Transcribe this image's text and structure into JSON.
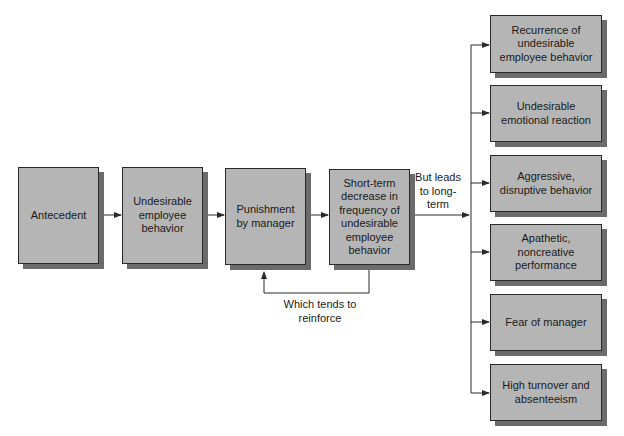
{
  "diagram": {
    "type": "flowchart",
    "chain": [
      {
        "id": "antecedent",
        "text": "Antecedent"
      },
      {
        "id": "undesirable-behavior",
        "text": "Undesirable employee behavior"
      },
      {
        "id": "punishment",
        "text": "Punishment by manager"
      },
      {
        "id": "short-term-decrease",
        "text": "Short-term decrease in frequency of undesirable employee behavior"
      }
    ],
    "feedback_label": "Which tends to reinforce",
    "branch_label": "But leads to long-term",
    "outcomes": [
      {
        "id": "recurrence",
        "text": "Recurrence of undesirable employee behavior"
      },
      {
        "id": "emotional-reaction",
        "text": "Undesirable emotional reaction"
      },
      {
        "id": "aggressive",
        "text": "Aggressive, disruptive behavior"
      },
      {
        "id": "apathetic",
        "text": "Apathetic, noncreative performance"
      },
      {
        "id": "fear",
        "text": "Fear of manager"
      },
      {
        "id": "turnover",
        "text": "High turnover and absenteeism"
      }
    ]
  },
  "colors": {
    "box_fill": "#b5b5b5",
    "box_shadow": "#6b6b6b",
    "line": "#2a2a2a"
  }
}
